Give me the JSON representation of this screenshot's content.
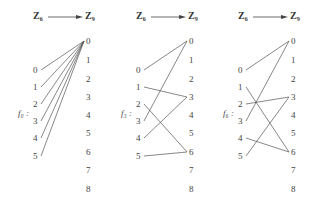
{
  "diagrams": [
    {
      "name": "f0",
      "label": "f₀ :",
      "domain_label": "Z₆",
      "codomain_label": "Z₉",
      "domain": [
        "0",
        "1",
        "2",
        "3",
        "4",
        "5"
      ],
      "codomain": [
        "0",
        "1",
        "2",
        "3",
        "4",
        "5",
        "6",
        "7",
        "8"
      ],
      "mapping": [
        0,
        0,
        0,
        0,
        0,
        0
      ]
    },
    {
      "name": "f3",
      "label": "f₃ :",
      "domain_label": "Z₆",
      "codomain_label": "Z₉",
      "domain": [
        "0",
        "1",
        "2",
        "3",
        "4",
        "5"
      ],
      "codomain": [
        "0",
        "1",
        "2",
        "3",
        "4",
        "5",
        "6",
        "7",
        "8"
      ],
      "mapping": [
        0,
        3,
        6,
        0,
        3,
        6
      ]
    },
    {
      "name": "f6",
      "label": "f₆ :",
      "domain_label": "Z₆",
      "codomain_label": "Z₉",
      "domain": [
        "0",
        "1",
        "2",
        "3",
        "4",
        "5"
      ],
      "codomain": [
        "0",
        "1",
        "2",
        "3",
        "4",
        "5",
        "6",
        "7",
        "8"
      ],
      "mapping": [
        0,
        6,
        3,
        0,
        6,
        3
      ]
    }
  ],
  "colors": {
    "line": "#555555",
    "text": "#444444"
  }
}
